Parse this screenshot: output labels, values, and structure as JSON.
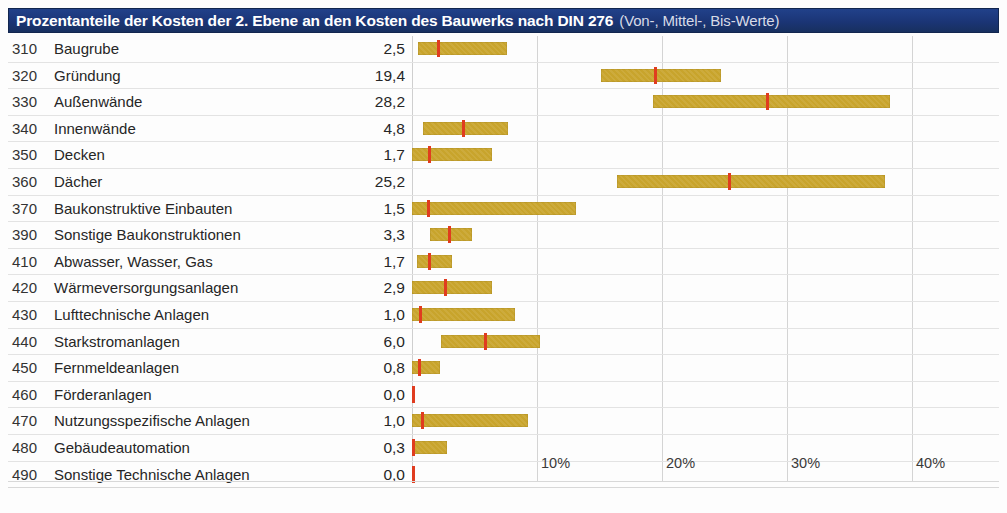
{
  "title": {
    "main": "Prozentanteile der Kosten der 2. Ebene an den Kosten des Bauwerks nach DIN 276",
    "sub": "(Von-, Mittel-, Bis-Werte)"
  },
  "colors": {
    "title_bar": "#1b3576",
    "title_text": "#ffffff",
    "title_sub_text": "#d7dbe6",
    "bar": "#c8a42c",
    "mid_marker": "#e03c1f",
    "grid": "#d4d4d4"
  },
  "axis": {
    "ticks": [
      "10%",
      "20%",
      "30%",
      "40%"
    ],
    "tick_values": [
      10,
      20,
      30,
      40
    ],
    "min": 0,
    "max": 47.6
  },
  "chart_data": {
    "type": "bar",
    "title": "Prozentanteile der Kosten der 2. Ebene an den Kosten des Bauwerks nach DIN 276 (Von-, Mittel-, Bis-Werte)",
    "xlabel": "",
    "ylabel": "",
    "xlim": [
      0,
      47.6
    ],
    "grid": true,
    "legend": "none",
    "columns": [
      "Kostengruppe",
      "Bezeichnung",
      "Mittelwert",
      "Von",
      "Mittel",
      "Bis"
    ],
    "rows": [
      {
        "code": "310",
        "name": "Baugrube",
        "value": "2,5",
        "von": 0.5,
        "mittel": 2.1,
        "bis": 7.6
      },
      {
        "code": "320",
        "name": "Gründung",
        "value": "19,4",
        "von": 15.1,
        "mittel": 19.5,
        "bis": 24.7
      },
      {
        "code": "330",
        "name": "Außenwände",
        "value": "28,2",
        "von": 19.3,
        "mittel": 28.4,
        "bis": 38.2
      },
      {
        "code": "340",
        "name": "Innenwände",
        "value": "4,8",
        "von": 0.9,
        "mittel": 4.1,
        "bis": 7.7
      },
      {
        "code": "350",
        "name": "Decken",
        "value": "1,7",
        "von": 0.0,
        "mittel": 1.4,
        "bis": 6.4
      },
      {
        "code": "360",
        "name": "Dächer",
        "value": "25,2",
        "von": 16.4,
        "mittel": 25.4,
        "bis": 37.8
      },
      {
        "code": "370",
        "name": "Baukonstruktive Einbauten",
        "value": "1,5",
        "von": 0.0,
        "mittel": 1.3,
        "bis": 13.1
      },
      {
        "code": "390",
        "name": "Sonstige Baukonstruktionen",
        "value": "3,3",
        "von": 1.4,
        "mittel": 3.0,
        "bis": 4.8
      },
      {
        "code": "410",
        "name": "Abwasser, Wasser, Gas",
        "value": "1,7",
        "von": 0.4,
        "mittel": 1.4,
        "bis": 3.2
      },
      {
        "code": "420",
        "name": "Wärmeversorgungsanlagen",
        "value": "2,9",
        "von": 0.0,
        "mittel": 2.7,
        "bis": 6.4
      },
      {
        "code": "430",
        "name": "Lufttechnische Anlagen",
        "value": "1,0",
        "von": 0.0,
        "mittel": 0.7,
        "bis": 8.2
      },
      {
        "code": "440",
        "name": "Starkstromanlagen",
        "value": "6,0",
        "von": 2.3,
        "mittel": 5.9,
        "bis": 10.2
      },
      {
        "code": "450",
        "name": "Fernmeldeanlagen",
        "value": "0,8",
        "von": 0.0,
        "mittel": 0.6,
        "bis": 2.2
      },
      {
        "code": "460",
        "name": "Förderanlagen",
        "value": "0,0",
        "von": 0.0,
        "mittel": 0.0,
        "bis": 0.2
      },
      {
        "code": "470",
        "name": "Nutzungsspezifische Anlagen",
        "value": "1,0",
        "von": 0.0,
        "mittel": 0.8,
        "bis": 9.3
      },
      {
        "code": "480",
        "name": "Gebäudeautomation",
        "value": "0,3",
        "von": 0.0,
        "mittel": 0.1,
        "bis": 2.8
      },
      {
        "code": "490",
        "name": "Sonstige Technische Anlagen",
        "value": "0,0",
        "von": 0.0,
        "mittel": 0.0,
        "bis": 0.2
      }
    ]
  }
}
